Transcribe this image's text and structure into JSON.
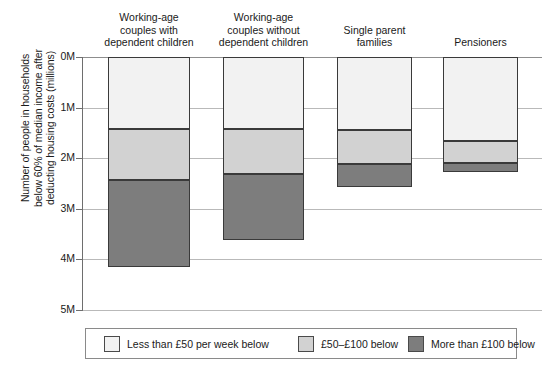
{
  "chart_data": {
    "type": "bar",
    "stacked": true,
    "title": "",
    "xlabel": "",
    "ylabel": "Number of people in households\nbelow 60% of median income after\ndeducting housing costs (millions)",
    "ylim": [
      0,
      5
    ],
    "y_inverted": true,
    "yticks": [
      "0M",
      "1M",
      "2M",
      "3M",
      "4M",
      "5M"
    ],
    "ytick_values": [
      0,
      1,
      2,
      3,
      4,
      5
    ],
    "grid": true,
    "grid_axis": "y",
    "legend_position": "bottom",
    "categories": [
      "Working-age\ncouples with\ndependent children",
      "Working-age\ncouples without\ndependent children",
      "Single parent\nfamilies",
      "Pensioners"
    ],
    "series": [
      {
        "name": "Less than £50 per week below",
        "color": "#f2f2f2",
        "values": [
          1.43,
          1.43,
          1.45,
          1.66
        ]
      },
      {
        "name": "£50–£100 below",
        "color": "#d2d2d2",
        "values": [
          1.0,
          0.88,
          0.66,
          0.43
        ]
      },
      {
        "name": "More than £100 below",
        "color": "#7d7d7d",
        "values": [
          1.72,
          1.31,
          0.46,
          0.18
        ]
      }
    ],
    "segment_tops": [
      [
        0,
        1.43,
        2.43
      ],
      [
        0,
        1.43,
        2.31
      ],
      [
        0,
        1.45,
        2.11
      ],
      [
        0,
        1.66,
        2.09
      ]
    ],
    "totals": [
      4.15,
      3.62,
      2.57,
      2.27
    ],
    "legend_entries": [
      "Less than £50 per week below",
      "£50–£100 below",
      "More than £100 below"
    ]
  }
}
